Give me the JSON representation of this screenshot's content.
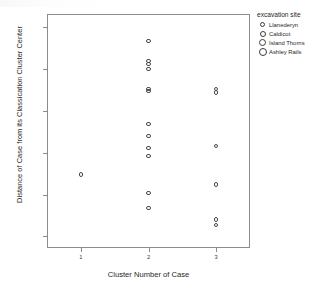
{
  "chart_data": {
    "type": "scatter",
    "title": "",
    "xlabel": "Cluster Number of Case",
    "ylabel": "Distance of Case from its Classication Cluster Center",
    "xtick_labels": [
      "1",
      "2",
      "3"
    ],
    "xtick_values": [
      1,
      2,
      3
    ],
    "ytick_labels": [
      "1.50",
      "1.25",
      "1.00",
      "0.75",
      "0.50",
      "0.25"
    ],
    "ytick_values": [
      1.5,
      1.25,
      1.0,
      0.75,
      0.5,
      0.25
    ],
    "xlim": [
      0.5,
      3.5
    ],
    "ylim": [
      0.18,
      1.58
    ],
    "grid": false,
    "marker": "open-circle",
    "marker_color": "#4a4a4a",
    "legend_position": "right",
    "legend_title": "excavation site",
    "points": [
      {
        "x": 1,
        "y": 0.62
      },
      {
        "x": 2,
        "y": 1.42
      },
      {
        "x": 2,
        "y": 1.3
      },
      {
        "x": 2,
        "y": 1.28
      },
      {
        "x": 2,
        "y": 1.25
      },
      {
        "x": 2,
        "y": 1.13
      },
      {
        "x": 2,
        "y": 1.12
      },
      {
        "x": 2,
        "y": 0.92
      },
      {
        "x": 2,
        "y": 0.85
      },
      {
        "x": 2,
        "y": 0.78
      },
      {
        "x": 2,
        "y": 0.73
      },
      {
        "x": 2,
        "y": 0.51
      },
      {
        "x": 2,
        "y": 0.42
      },
      {
        "x": 3,
        "y": 1.13
      },
      {
        "x": 3,
        "y": 1.11
      },
      {
        "x": 3,
        "y": 0.79
      },
      {
        "x": 3,
        "y": 0.56
      },
      {
        "x": 3,
        "y": 0.35
      },
      {
        "x": 3,
        "y": 0.32
      }
    ]
  },
  "legend": {
    "title": "excavation site",
    "items": [
      {
        "label": "Llanederyn",
        "size": 5
      },
      {
        "label": "Caldicot",
        "size": 6
      },
      {
        "label": "Island Thorns",
        "size": 7
      },
      {
        "label": "Ashley Rails",
        "size": 8
      }
    ]
  },
  "axes": {
    "x_title": "Cluster Number of Case",
    "y_title": "Distance of Case from its Classication Cluster Center"
  }
}
